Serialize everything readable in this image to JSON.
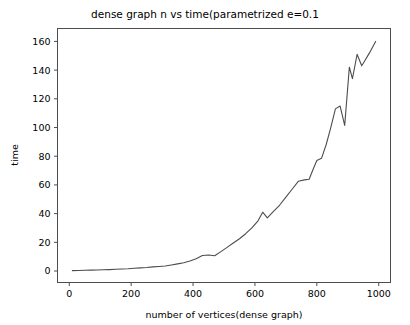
{
  "chart_data": {
    "type": "line",
    "title": "dense graph n vs time(parametrized e=0.1",
    "xlabel": "number of vertices(dense graph)",
    "ylabel": "time",
    "xlim": [
      -38,
      1038
    ],
    "ylim": [
      -8,
      169
    ],
    "xticks": [
      0,
      200,
      400,
      600,
      800,
      1000
    ],
    "yticks": [
      0,
      20,
      40,
      60,
      80,
      100,
      120,
      140,
      160
    ],
    "grid": false,
    "legend": null,
    "line_color": "#4d4d4d",
    "series": [
      {
        "name": "time",
        "x": [
          10,
          30,
          50,
          70,
          90,
          110,
          130,
          150,
          170,
          190,
          210,
          230,
          250,
          270,
          290,
          310,
          330,
          350,
          370,
          390,
          410,
          430,
          450,
          470,
          490,
          510,
          530,
          550,
          570,
          590,
          610,
          625,
          640,
          660,
          680,
          700,
          720,
          740,
          760,
          775,
          790,
          800,
          815,
          830,
          845,
          860,
          875,
          890,
          905,
          915,
          930,
          945,
          955,
          970,
          990
        ],
        "y": [
          0.3,
          0.4,
          0.5,
          0.6,
          0.7,
          0.9,
          1.0,
          1.2,
          1.4,
          1.6,
          1.9,
          2.2,
          2.5,
          2.9,
          3.2,
          3.5,
          4.2,
          5.0,
          5.8,
          7.0,
          8.6,
          10.8,
          11.2,
          10.6,
          13.5,
          16.5,
          19.5,
          22.5,
          26.0,
          30.0,
          35.0,
          41.0,
          37.0,
          41.5,
          46.0,
          51.5,
          57.0,
          62.5,
          63.5,
          64.0,
          72.0,
          77.0,
          78.5,
          88.0,
          100.0,
          113.0,
          115.0,
          101.5,
          142.0,
          134.0,
          151.0,
          143.0,
          146.5,
          152.0,
          160.0
        ]
      }
    ]
  }
}
